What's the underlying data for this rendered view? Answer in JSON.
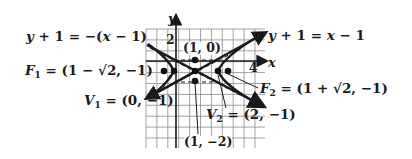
{
  "chart_data": {
    "type": "diagram",
    "title": "",
    "axes": {
      "x_label": "x",
      "y_label": "y",
      "x_tick_label": "4",
      "y_tick_label": "2"
    },
    "asymptotes": [
      {
        "label": "y + 1 = x − 1",
        "slope": 1,
        "through": [
          1,
          -1
        ]
      },
      {
        "label": "y + 1 = −(x − 1)",
        "slope": -1,
        "through": [
          1,
          -1
        ]
      }
    ],
    "points": [
      {
        "name": "center-top",
        "label": "(1, 0)",
        "x": 1,
        "y": 0
      },
      {
        "name": "center",
        "label": "",
        "x": 1,
        "y": -1
      },
      {
        "name": "center-bottom",
        "label": "(1, −2)",
        "x": 1,
        "y": -2
      },
      {
        "name": "V1",
        "label": "V1 = (0, −1)",
        "x": 0,
        "y": -1
      },
      {
        "name": "V2",
        "label": "V2 = (2, −1)",
        "x": 2,
        "y": -1
      },
      {
        "name": "F1",
        "label": "F1 = (1 − √2, −1)",
        "x": -0.414,
        "y": -1
      },
      {
        "name": "F2",
        "label": "F2 = (1 + √2, −1)",
        "x": 2.414,
        "y": -1
      }
    ],
    "grid": true
  },
  "labels": {
    "asym_neg": {
      "lhs": "y",
      "rest": " + 1 = −(",
      "x": "x",
      "tail": " − 1)"
    },
    "asym_pos": {
      "lhs": "y",
      "rest": " + 1 = ",
      "x": "x",
      "tail": " − 1"
    },
    "f1": {
      "name": "F",
      "sub": "1",
      "value": " = (1 − √2, −1)"
    },
    "f2": {
      "name": "F",
      "sub": "2",
      "value": " = (1 + √2, −1)"
    },
    "v1": {
      "name": "V",
      "sub": "1",
      "value": " = (0, −1)"
    },
    "v2": {
      "name": "V",
      "sub": "2",
      "value": " = (2, −1)"
    },
    "pt_top": "(1, 0)",
    "pt_bottom": "(1, −2)",
    "axis_x": "x",
    "axis_y": "y",
    "tick_x4": "4",
    "tick_y2": "2"
  }
}
